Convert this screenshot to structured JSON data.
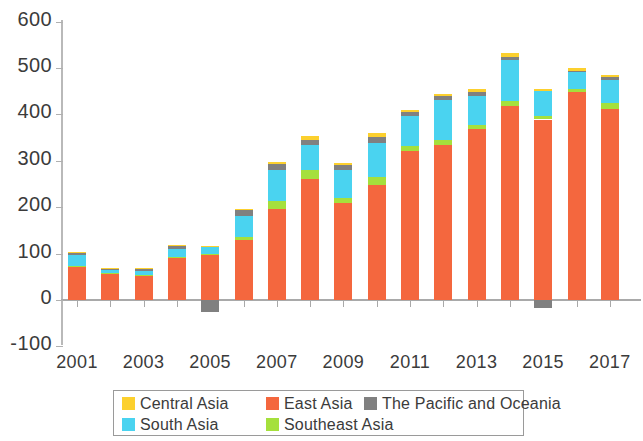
{
  "chart_data": {
    "type": "bar",
    "title": "",
    "subtitle": "",
    "xlabel": "",
    "ylabel": "",
    "stacked": true,
    "grid": false,
    "legend_position": "bottom",
    "ylim": [
      -100,
      600
    ],
    "yticks": [
      -100,
      0,
      100,
      200,
      300,
      400,
      500,
      600
    ],
    "ytick_labels": [
      "-100",
      "0",
      "100",
      "200",
      "300",
      "400",
      "500",
      "600"
    ],
    "categories": [
      2001,
      2002,
      2003,
      2004,
      2005,
      2006,
      2007,
      2008,
      2009,
      2010,
      2011,
      2012,
      2013,
      2014,
      2015,
      2016,
      2017
    ],
    "xtick_labels": [
      "2001",
      "2003",
      "2005",
      "2007",
      "2009",
      "2011",
      "2013",
      "2015",
      "2017"
    ],
    "xticks": [
      2001,
      2003,
      2005,
      2007,
      2009,
      2011,
      2013,
      2015,
      2017
    ],
    "series": [
      {
        "name": "East Asia",
        "color": "#f4673e",
        "values": [
          72,
          58,
          53,
          90,
          97,
          130,
          197,
          260,
          210,
          248,
          322,
          333,
          368,
          419,
          389,
          449,
          412
        ]
      },
      {
        "name": "Southeast Asia",
        "color": "#a5e03c",
        "values": [
          1,
          1,
          1,
          2,
          3,
          6,
          16,
          20,
          9,
          18,
          9,
          12,
          10,
          10,
          8,
          6,
          12
        ]
      },
      {
        "name": "South Asia",
        "color": "#4ad3f0",
        "values": [
          23,
          6,
          9,
          18,
          14,
          45,
          68,
          55,
          62,
          72,
          66,
          85,
          62,
          89,
          54,
          37,
          50
        ]
      },
      {
        "name": "The Pacific and Oceania",
        "color": "#808080",
        "values": [
          6,
          3,
          4,
          6,
          -25,
          12,
          12,
          10,
          9,
          14,
          8,
          9,
          9,
          6,
          -18,
          2,
          6
        ]
      },
      {
        "name": "Central Asia",
        "color": "#fcd02e",
        "values": [
          2,
          2,
          2,
          3,
          3,
          4,
          5,
          8,
          5,
          7,
          5,
          5,
          6,
          8,
          4,
          5,
          4
        ]
      }
    ],
    "totals": [
      104,
      70,
      69,
      119,
      117,
      197,
      298,
      353,
      295,
      359,
      410,
      444,
      455,
      532,
      455,
      499,
      484
    ],
    "legend": [
      {
        "label": "Central Asia",
        "color": "#fcd02e",
        "swatch": "legend-swatch-central-asia"
      },
      {
        "label": "East Asia",
        "color": "#f4673e",
        "swatch": "legend-swatch-east-asia"
      },
      {
        "label": "The Pacific and Oceania",
        "color": "#808080",
        "swatch": "legend-swatch-pacific-oceania"
      },
      {
        "label": "South Asia",
        "color": "#4ad3f0",
        "swatch": "legend-swatch-south-asia"
      },
      {
        "label": "Southeast Asia",
        "color": "#a5e03c",
        "swatch": "legend-swatch-southeast-asia"
      }
    ]
  }
}
